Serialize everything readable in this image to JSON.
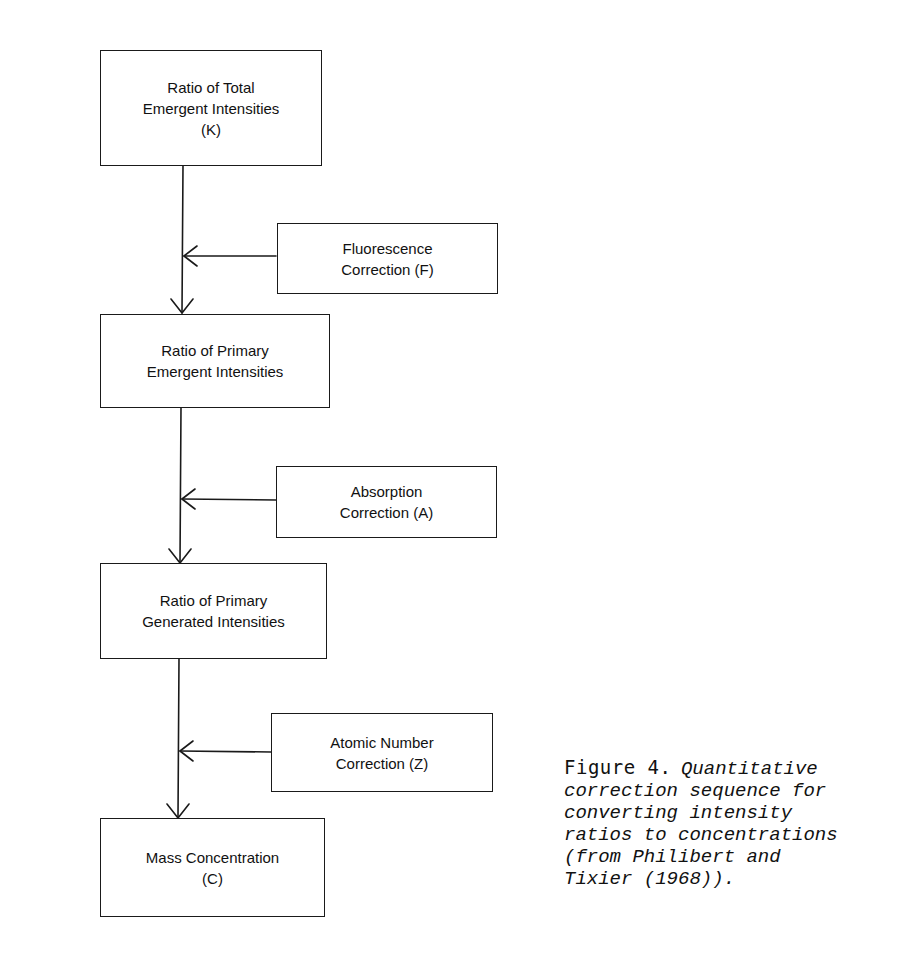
{
  "diagram": {
    "type": "flowchart",
    "main_boxes": [
      {
        "id": "K",
        "lines": [
          "Ratio of Total",
          "Emergent Intensities",
          "(K)"
        ]
      },
      {
        "id": "primary-emergent",
        "lines": [
          "Ratio of Primary",
          "Emergent Intensities"
        ]
      },
      {
        "id": "primary-generated",
        "lines": [
          "Ratio of Primary",
          "Generated Intensities"
        ]
      },
      {
        "id": "C",
        "lines": [
          "Mass Concentration",
          "(C)"
        ]
      }
    ],
    "correction_boxes": [
      {
        "id": "F",
        "lines": [
          "Fluorescence",
          "Correction (F)"
        ]
      },
      {
        "id": "A",
        "lines": [
          "Absorption",
          "Correction (A)"
        ]
      },
      {
        "id": "Z",
        "lines": [
          "Atomic Number",
          "Correction (Z)"
        ]
      }
    ],
    "edges": [
      {
        "from": "K",
        "to": "primary-emergent",
        "via": "F"
      },
      {
        "from": "primary-emergent",
        "to": "primary-generated",
        "via": "A"
      },
      {
        "from": "primary-generated",
        "to": "C",
        "via": "Z"
      }
    ]
  },
  "caption": {
    "label": "Figure 4.",
    "lines": [
      "Quantitative",
      "correction sequence for",
      "converting intensity",
      "ratios to concentrations",
      "(from Philibert and",
      "Tixier (1968))."
    ]
  }
}
